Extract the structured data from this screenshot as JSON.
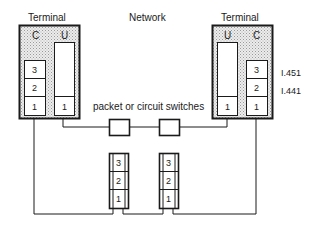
{
  "diagram": {
    "left_terminal": {
      "title": "Terminal",
      "columns": {
        "c": "C",
        "u": "U"
      },
      "c_layers": [
        "3",
        "2",
        "1"
      ],
      "u_layers": [
        "1"
      ]
    },
    "network": {
      "title": "Network"
    },
    "right_terminal": {
      "title": "Terminal",
      "columns": {
        "u": "U",
        "c": "C"
      },
      "c_layers": [
        "3",
        "2",
        "1"
      ],
      "u_layers": [
        "1"
      ]
    },
    "protocol_labels": {
      "layer3": "I.451",
      "layer2": "I.441"
    },
    "switches_label": "packet or circuit switches",
    "network_stacks": [
      {
        "layers": [
          "3",
          "2",
          "1"
        ]
      },
      {
        "layers": [
          "3",
          "2",
          "1"
        ]
      }
    ]
  },
  "colors": {
    "line": "#1a1a1a",
    "stipple_bg": "#e6e6e6",
    "stipple_dot": "#9a9a9a"
  }
}
